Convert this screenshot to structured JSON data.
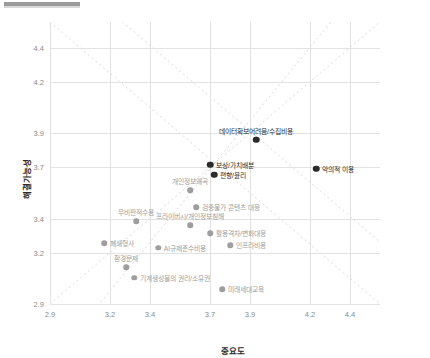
{
  "chart_data": {
    "type": "scatter",
    "title": "",
    "xlabel": "중요도",
    "ylabel": "해결가능성",
    "xlim": [
      2.9,
      4.55
    ],
    "ylim": [
      2.9,
      4.55
    ],
    "xticks": [
      "2.9",
      "3.2",
      "3.4",
      "3.7",
      "3.9",
      "4.2",
      "4.4"
    ],
    "xtick_values": [
      2.9,
      3.2,
      3.4,
      3.7,
      3.9,
      4.2,
      4.4
    ],
    "yticks": [
      "2.9",
      "3.2",
      "3.4",
      "3.7",
      "3.9",
      "4.2",
      "4.4"
    ],
    "ytick_values": [
      2.9,
      3.2,
      3.4,
      3.7,
      3.9,
      4.2,
      4.4
    ],
    "grid": true,
    "legend": "none",
    "colors": {
      "dark_point": "#2b2b2b",
      "light_point": "#9e9e9e",
      "dark_label": "#2b2b2b",
      "light_label": "#9e9e9e",
      "gridline": "#e2e2e2",
      "diagonal": "#d9d9d9",
      "axis_text": "#8a8a8a"
    },
    "annotations": [
      {
        "text": "diagonal dashed reference line (rising)",
        "style": "dashed"
      },
      {
        "text": "diagonal dashed reference line (falling)",
        "style": "dashed"
      }
    ],
    "points": [
      {
        "label": "데이터확보어려움/수집비용",
        "x": 3.93,
        "y": 3.86,
        "emphasis": "dark",
        "label_pos": "top"
      },
      {
        "label": "악의적 이용",
        "x": 4.23,
        "y": 3.69,
        "emphasis": "dark",
        "label_pos": "right"
      },
      {
        "label": "보상/가치배분",
        "x": 3.7,
        "y": 3.715,
        "emphasis": "dark",
        "label_pos": "right"
      },
      {
        "label": "편향/윤리",
        "x": 3.72,
        "y": 3.655,
        "emphasis": "dark",
        "label_pos": "right"
      },
      {
        "label": "개인정보왜곡",
        "x": 3.6,
        "y": 3.565,
        "emphasis": "light",
        "label_pos": "top"
      },
      {
        "label": "검증불가 콘텐츠 대응",
        "x": 3.63,
        "y": 3.465,
        "emphasis": "light",
        "label_pos": "right"
      },
      {
        "label": "프라이버시/개인정보침해",
        "x": 3.6,
        "y": 3.36,
        "emphasis": "light",
        "label_pos": "top"
      },
      {
        "label": "활용격차/변화대응",
        "x": 3.7,
        "y": 3.315,
        "emphasis": "light",
        "label_pos": "right"
      },
      {
        "label": "인프라비용",
        "x": 3.8,
        "y": 3.245,
        "emphasis": "light",
        "label_pos": "right"
      },
      {
        "label": "무비판적수용",
        "x": 3.33,
        "y": 3.385,
        "emphasis": "light",
        "label_pos": "top"
      },
      {
        "label": "폐쇄형사",
        "x": 3.17,
        "y": 3.255,
        "emphasis": "light",
        "label_pos": "right"
      },
      {
        "label": "AI규제준수비용",
        "x": 3.44,
        "y": 3.23,
        "emphasis": "light",
        "label_pos": "right"
      },
      {
        "label": "환경문제",
        "x": 3.28,
        "y": 3.115,
        "emphasis": "light",
        "label_pos": "top"
      },
      {
        "label": "기계생성물의 권리/소유권",
        "x": 3.32,
        "y": 3.055,
        "emphasis": "light",
        "label_pos": "right"
      },
      {
        "label": "미래세대교육",
        "x": 3.76,
        "y": 2.985,
        "emphasis": "light",
        "label_pos": "right"
      }
    ]
  }
}
